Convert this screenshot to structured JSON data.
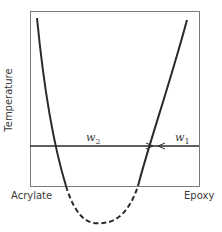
{
  "diagram": {
    "type": "phase-diagram",
    "y_axis_label": "Temperature",
    "x_left_label": "Acrylate",
    "x_right_label": "Epoxy",
    "tie_line_labels": {
      "left": "w",
      "left_sub": "2",
      "right": "w",
      "right_sub": "1"
    },
    "colors": {
      "line": "#2a2a2a",
      "frame": "#7a7a7a"
    }
  }
}
